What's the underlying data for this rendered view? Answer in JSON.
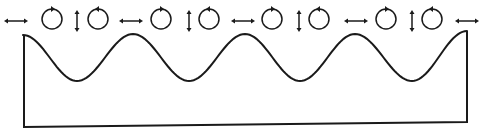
{
  "diagram": {
    "title": "Surface wave particle motion",
    "ink_color": "#1a1a1a",
    "background": "#ffffff",
    "stroke_width": 2,
    "wave": {
      "type": "sinusoid",
      "start": [
        23,
        35
      ],
      "end": [
        467,
        31
      ],
      "crests_x": [
        23,
        133,
        245,
        355,
        467
      ],
      "troughs_x": [
        77,
        189,
        300,
        412
      ],
      "crest_y": 34,
      "trough_y": 81
    },
    "container": {
      "left_edge_x": 24,
      "right_edge_x": 467,
      "bottom_left": [
        24,
        127
      ],
      "bottom_right": [
        467,
        122
      ]
    },
    "motion_indicators": [
      {
        "type": "horizontal-arrow",
        "x": 16,
        "y": 21
      },
      {
        "type": "circle",
        "direction": "clockwise",
        "cx": 52,
        "cy": 19
      },
      {
        "type": "vertical-arrow",
        "x": 77,
        "y": 21
      },
      {
        "type": "circle",
        "direction": "counter-clockwise",
        "cx": 98,
        "cy": 19
      },
      {
        "type": "horizontal-arrow",
        "x": 131,
        "y": 21
      },
      {
        "type": "circle",
        "direction": "clockwise",
        "cx": 161,
        "cy": 19
      },
      {
        "type": "vertical-arrow",
        "x": 189,
        "y": 21
      },
      {
        "type": "circle",
        "direction": "counter-clockwise",
        "cx": 209,
        "cy": 19
      },
      {
        "type": "horizontal-arrow",
        "x": 243,
        "y": 21
      },
      {
        "type": "circle",
        "direction": "clockwise",
        "cx": 272,
        "cy": 19
      },
      {
        "type": "vertical-arrow",
        "x": 299,
        "y": 21
      },
      {
        "type": "circle",
        "direction": "counter-clockwise",
        "cx": 319,
        "cy": 19
      },
      {
        "type": "horizontal-arrow",
        "x": 356,
        "y": 21
      },
      {
        "type": "circle",
        "direction": "clockwise",
        "cx": 386,
        "cy": 19
      },
      {
        "type": "vertical-arrow",
        "x": 412,
        "y": 21
      },
      {
        "type": "circle",
        "direction": "counter-clockwise",
        "cx": 432,
        "cy": 19
      },
      {
        "type": "horizontal-arrow",
        "x": 467,
        "y": 21
      }
    ]
  }
}
